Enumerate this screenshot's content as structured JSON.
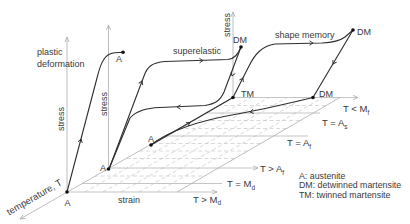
{
  "plastic_deformation": {
    "title": [
      "plastic",
      "deformation"
    ],
    "stress_label": "stress",
    "end_point": "A"
  },
  "superelastic": {
    "title": "superelastic",
    "stress_label": "stress",
    "start_point": "A",
    "peak_point": "DM"
  },
  "shape_memory": {
    "title": "shape memory",
    "stress_label": "stress",
    "start_point": "A",
    "twinned_point": "TM",
    "loaded_point": "DM",
    "unloaded_point": "DM"
  },
  "axes": {
    "origin_point": "A",
    "strain": "strain",
    "temperature": "temperature, T"
  },
  "temperature_levels": [
    {
      "text": "T < M",
      "sub": "f"
    },
    {
      "text": "T = A",
      "sub": "s"
    },
    {
      "text": "T = A",
      "sub": "f"
    },
    {
      "text": "T > A",
      "sub": "f"
    },
    {
      "text": "T = M",
      "sub": "d"
    },
    {
      "text": "T > M",
      "sub": "d"
    }
  ],
  "legend": [
    "A: austenite",
    "DM: detwinned martensite",
    "TM: twinned martensite"
  ],
  "colors": {
    "curves": "#2e2e2e",
    "axes": "#adadad",
    "grid": "#c9c9c9",
    "text": "#3a3a3a"
  }
}
